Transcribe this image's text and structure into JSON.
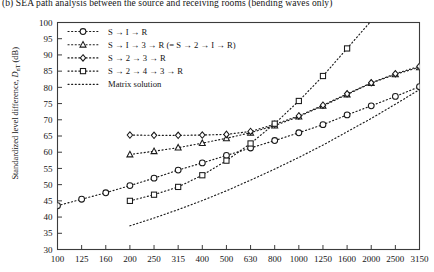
{
  "caption": "(b) SEA path analysis between the source and receiving rooms (bending waves only)",
  "axis": {
    "ylabel_prefix": "Standardized level difference, ",
    "ylabel_symbol": "D",
    "ylabel_sub": "nT",
    "ylabel_unit": " (dB)"
  },
  "chart_data": {
    "type": "line",
    "title": "(b) SEA path analysis between the source and receiving rooms (bending waves only)",
    "xlabel": "",
    "ylabel": "Standardized level difference, DnT (dB)",
    "xscale": "log-thirdoctave",
    "grid": false,
    "legend_position": "upper-left-inside",
    "categories": [
      "100",
      "125",
      "160",
      "200",
      "250",
      "315",
      "400",
      "500",
      "630",
      "800",
      "1000",
      "1250",
      "1600",
      "2000",
      "2500",
      "3150"
    ],
    "x": [
      100,
      125,
      160,
      200,
      250,
      315,
      400,
      500,
      630,
      800,
      1000,
      1250,
      1600,
      2000,
      2500,
      3150
    ],
    "ylim": [
      30,
      100
    ],
    "yticks": [
      30,
      35,
      40,
      45,
      50,
      55,
      60,
      65,
      70,
      75,
      80,
      85,
      90,
      95,
      100
    ],
    "xlim_labels": [
      "100",
      "3150"
    ],
    "series": [
      {
        "name": "S → I → R",
        "marker": "circle",
        "linestyle": "dotted",
        "color": "#1a1a1a",
        "values": [
          43.5,
          45.5,
          47.5,
          49.7,
          52.0,
          54.5,
          56.7,
          59.0,
          61.3,
          63.6,
          66.0,
          68.5,
          71.5,
          74.3,
          77.2,
          80.2
        ]
      },
      {
        "name": "S → I → 3 → R (= S → 2 → I → R)",
        "marker": "triangle",
        "linestyle": "dotted",
        "color": "#1a1a1a",
        "values": [
          null,
          null,
          null,
          59.3,
          60.3,
          61.4,
          62.8,
          64.3,
          66.0,
          68.2,
          71.0,
          74.3,
          77.8,
          81.3,
          84.0,
          86.2
        ]
      },
      {
        "name": "S → 2 → 3 → R",
        "marker": "diamond",
        "linestyle": "dotted",
        "color": "#1a1a1a",
        "values": [
          null,
          null,
          null,
          65.3,
          65.2,
          65.2,
          65.3,
          65.5,
          66.4,
          68.6,
          71.2,
          74.5,
          78.0,
          81.4,
          84.2,
          86.5
        ]
      },
      {
        "name": "S → 2 → 4 → 3 → R",
        "marker": "square",
        "linestyle": "dotted",
        "color": "#1a1a1a",
        "values": [
          null,
          null,
          null,
          45.0,
          46.9,
          49.3,
          52.9,
          57.4,
          62.7,
          68.8,
          75.8,
          83.5,
          92.0,
          null,
          null,
          null
        ]
      },
      {
        "name": "Matrix solution",
        "marker": "none",
        "linestyle": "dotted",
        "color": "#1a1a1a",
        "values": [
          null,
          null,
          null,
          37.3,
          39.7,
          42.3,
          45.1,
          48.1,
          51.4,
          54.8,
          58.4,
          62.2,
          66.3,
          70.4,
          74.8,
          79.3
        ]
      }
    ],
    "legend": [
      {
        "label": "S → I → R",
        "marker": "circle"
      },
      {
        "label": "S → I → 3 → R (= S → 2 → I → R)",
        "marker": "triangle"
      },
      {
        "label": "S → 2 → 3 → R",
        "marker": "diamond"
      },
      {
        "label": "S → 2 → 4 → 3 → R",
        "marker": "square"
      },
      {
        "label": "Matrix solution",
        "marker": "none"
      }
    ]
  }
}
